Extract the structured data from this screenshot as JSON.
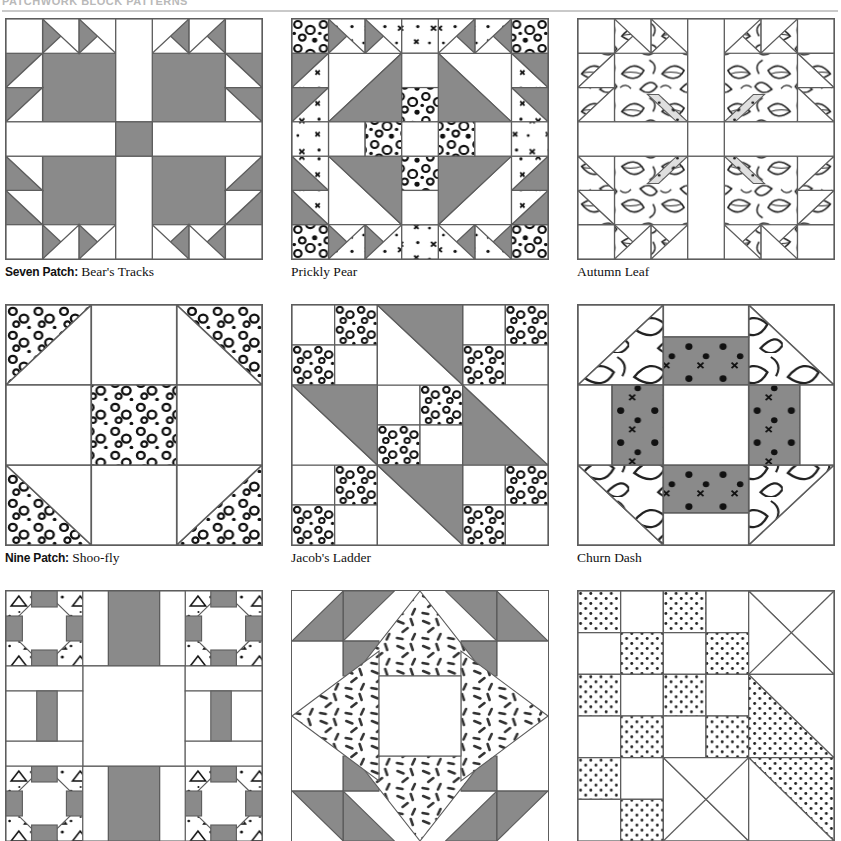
{
  "header": {
    "title": "PATCHWORK BLOCK PATTERNS",
    "rule": true
  },
  "colors": {
    "solid_gray": "#8a8a8a",
    "dark_gray": "#6f6f6f",
    "line": "#5d5d5d",
    "background": "#ffffff",
    "caption_text": "#111111",
    "header_text": "#b9b9b9"
  },
  "blocks": [
    {
      "id": "bears-tracks",
      "category": "Seven Patch:",
      "name": "Bear's Tracks",
      "grid": "7x7",
      "fabrics": [
        "solid-gray",
        "white"
      ],
      "row": 1,
      "col": 1
    },
    {
      "id": "prickly-pear",
      "category": "",
      "name": "Prickly Pear",
      "grid": "7x7",
      "fabrics": [
        "solid-gray",
        "white",
        "bubble-print"
      ],
      "row": 1,
      "col": 2
    },
    {
      "id": "autumn-leaf",
      "category": "",
      "name": "Autumn Leaf",
      "grid": "7x7",
      "fabrics": [
        "leaf-print",
        "white",
        "speckle-print"
      ],
      "row": 1,
      "col": 3
    },
    {
      "id": "shoo-fly",
      "category": "Nine Patch:",
      "name": "Shoo-fly",
      "grid": "3x3",
      "fabrics": [
        "bubble-print",
        "white"
      ],
      "row": 2,
      "col": 1
    },
    {
      "id": "jacobs-ladder",
      "category": "",
      "name": "Jacob's Ladder",
      "grid": "3x3",
      "fabrics": [
        "solid-gray",
        "white",
        "bubble-print"
      ],
      "row": 2,
      "col": 2
    },
    {
      "id": "churn-dash",
      "category": "",
      "name": "Churn Dash",
      "grid": "3x3",
      "fabrics": [
        "leaf-print",
        "dark-speckle",
        "white"
      ],
      "row": 2,
      "col": 3
    },
    {
      "id": "block-bottom-left",
      "category": "",
      "name": "",
      "grid": "5x5",
      "fabrics": [
        "solid-gray",
        "triangle-print",
        "white"
      ],
      "row": 3,
      "col": 1
    },
    {
      "id": "block-bottom-center",
      "category": "",
      "name": "",
      "grid": "star",
      "fabrics": [
        "solid-gray",
        "dash-print",
        "white"
      ],
      "row": 3,
      "col": 2
    },
    {
      "id": "block-bottom-right",
      "category": "",
      "name": "",
      "grid": "checker-diagonal",
      "fabrics": [
        "dot-print",
        "white"
      ],
      "row": 3,
      "col": 3
    }
  ]
}
